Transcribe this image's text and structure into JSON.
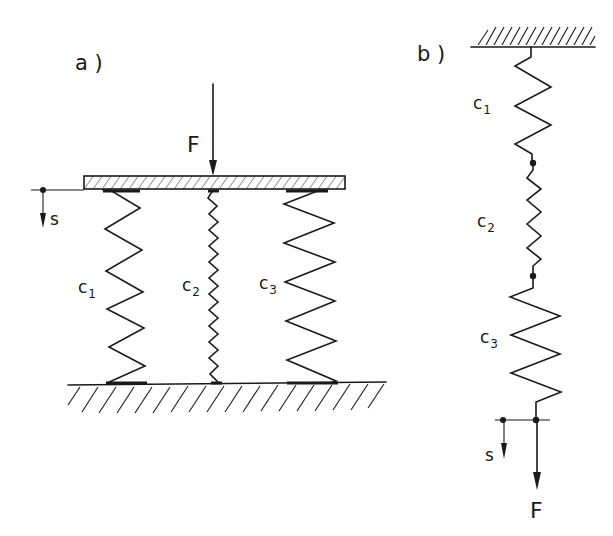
{
  "diagram": {
    "type": "spring-system-schematic",
    "panel_a": {
      "label": "a )",
      "description": "springs in parallel",
      "force_label": "F",
      "displacement_label": "s",
      "springs": [
        {
          "name": "c",
          "sub": "1"
        },
        {
          "name": "c",
          "sub": "2"
        },
        {
          "name": "c",
          "sub": "3"
        }
      ]
    },
    "panel_b": {
      "label": "b )",
      "description": "springs in series",
      "force_label": "F",
      "displacement_label": "s",
      "springs": [
        {
          "name": "c",
          "sub": "1"
        },
        {
          "name": "c",
          "sub": "2"
        },
        {
          "name": "c",
          "sub": "3"
        }
      ]
    },
    "colors": {
      "ink": "#1a1a1a",
      "background": "#ffffff"
    }
  }
}
